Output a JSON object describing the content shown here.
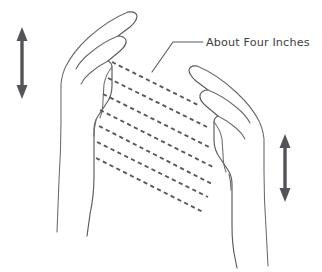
{
  "illustration": {
    "title": "Two facing hands with energy lines",
    "background_color": "#ffffff",
    "line_color": "#5a5a5f",
    "arrow_color": "#545458",
    "text_color": "#3d3d42"
  },
  "annotation": {
    "label": "About Four Inches",
    "label_x": 206,
    "label_y": 43,
    "leader": {
      "name": "leader-line",
      "path": "M 203 42 L 173 42 L 152 72"
    }
  },
  "arrows": [
    {
      "name": "left-vertical-double-arrow",
      "description": "double-headed vertical arrow at left hand",
      "cx": 22,
      "top": 27,
      "bottom": 99,
      "head_width": 11,
      "head_height": 14,
      "shaft_width": 3.4
    },
    {
      "name": "right-vertical-double-arrow",
      "description": "double-headed vertical arrow at right hand",
      "cx": 285,
      "top": 134,
      "bottom": 202,
      "head_width": 11,
      "head_height": 14,
      "shaft_width": 3.4
    }
  ],
  "energy_lines": {
    "name": "dashed-energy-lines",
    "count": 7,
    "dash_pattern": "4.2 3.4",
    "description": "seven parallel dashed diagonal lines running from the left palm down to the right palm",
    "segments": [
      "M 112 62 L 200 106",
      "M 108 78 L 207 127",
      "M 103 94 L 211 148",
      "M 100 110 L 213 167",
      "M 99 126 L 212 184",
      "M 97 142 L 208 197",
      "M 96 158 L 203 212"
    ]
  },
  "left_hand": {
    "name": "left-hand-figure",
    "description": "open left hand pointing up and to the right, palm facing right",
    "outline": "M 128 12 Q 136 11 137 16 Q 137 21 130 27 L 118 36 Q 124 36 126 40 Q 127 45 120 51 L 108 61 Q 112 63 112 67 L 112 86 Q 112 96 106 104 L 98 116 Q 94 122 94 130 L 94 176 Q 94 196 90 214 L 87 236",
    "details": [
      "M 128 12 Q 108 20 88 38 Q 73 52 66 66 Q 62 74 61 84 L 61 120 Q 61 150 59 180 L 57 232",
      "M 118 36 Q 103 42 90 53 Q 80 61 76 69",
      "M 108 61 Q 98 66 90 73 Q 84 78 81 84",
      "M 112 67 Q 106 74 104 84 L 103 100 Q 103 110 100 118",
      "M 96 120 Q 94 128 94 136"
    ]
  },
  "right_hand": {
    "name": "right-hand-figure",
    "description": "open right hand pointing up and to the left, palm facing left",
    "outline": "M 197 66 Q 190 65 189 70 Q 189 75 196 81 L 208 90 Q 202 90 200 95 Q 199 100 206 106 L 218 116 Q 214 118 214 122 L 214 140 Q 214 150 220 158 L 228 170 Q 232 176 232 184 L 232 226 Q 232 244 235 258 L 237 268",
    "details": [
      "M 197 66 Q 217 74 237 93 Q 252 107 259 121 Q 263 129 264 139 L 264 172 Q 264 200 266 228 L 268 266",
      "M 208 90 Q 223 96 236 107 Q 246 115 250 123",
      "M 218 116 Q 228 121 236 128 Q 242 133 245 139",
      "M 214 122 Q 220 129 222 139 L 223 154 Q 223 164 226 172",
      "M 229 174 Q 231 182 231 190"
    ]
  }
}
